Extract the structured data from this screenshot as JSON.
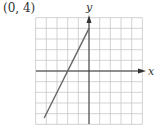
{
  "annotation": "(0, 4)",
  "chart_data": {
    "type": "line",
    "title": "",
    "xlabel": "x",
    "ylabel": "y",
    "xlim": [
      -5,
      5
    ],
    "ylim": [
      -5,
      5
    ],
    "grid": true,
    "grid_step": 1,
    "series": [
      {
        "name": "y = 2x + 4",
        "x": [
          -4.2,
          -2,
          0
        ],
        "y": [
          -4.4,
          0,
          4
        ]
      }
    ],
    "annotations": [
      {
        "text": "(0, 4)",
        "point": [
          0,
          4
        ]
      }
    ]
  },
  "colors": {
    "grid": "#c8c8c8",
    "axis": "#333333",
    "line": "#666666"
  }
}
